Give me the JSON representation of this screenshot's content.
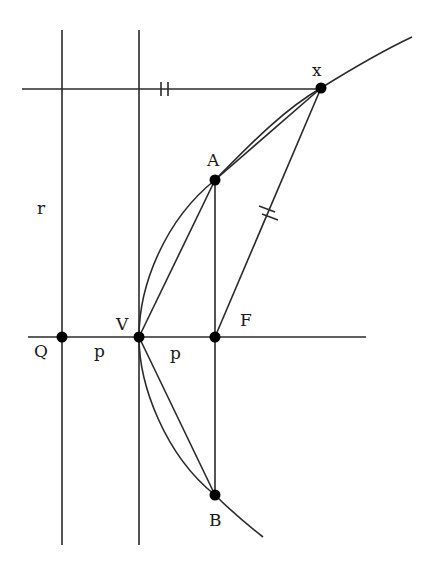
{
  "diagram": {
    "type": "parabola-focus-directrix",
    "colors": {
      "stroke": "#2a2a2a",
      "point": "#000000",
      "background": "#ffffff"
    },
    "labels": {
      "x": "x",
      "A": "A",
      "r": "r",
      "V": "V",
      "F": "F",
      "Q": "Q",
      "p_left": "p",
      "p_right": "p",
      "B": "B"
    },
    "points": [
      {
        "name": "Q",
        "x": 62,
        "y": 337
      },
      {
        "name": "V",
        "x": 139,
        "y": 337
      },
      {
        "name": "F",
        "x": 215,
        "y": 337
      },
      {
        "name": "A",
        "x": 215,
        "y": 180
      },
      {
        "name": "B",
        "x": 215,
        "y": 495
      },
      {
        "name": "x",
        "x": 321,
        "y": 88
      }
    ],
    "tick_marks": [
      {
        "segment": "horizontal line to x",
        "count": 2
      },
      {
        "segment": "xF",
        "count": 2
      }
    ]
  }
}
